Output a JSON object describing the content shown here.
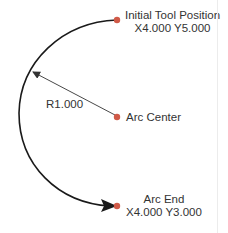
{
  "diagram": {
    "start": {
      "label": "Initial Tool Position",
      "coords": "X4.000 Y5.000"
    },
    "center": {
      "label": "Arc Center"
    },
    "end": {
      "label": "Arc End",
      "coords": "X4.000 Y3.000"
    },
    "radius_label": "R1.000",
    "colors": {
      "point": "#d05a48",
      "arc": "#1a1a1a",
      "text": "#333333"
    }
  }
}
